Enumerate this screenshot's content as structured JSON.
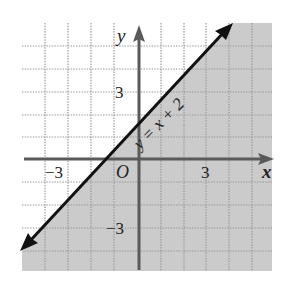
{
  "figure": {
    "type": "linear-inequality-graph",
    "equation_label": "y = x + 2",
    "boundary_line": {
      "slope": 1,
      "intercept": 2,
      "style": "solid",
      "arrows": "both"
    },
    "shaded_region": "below-right of line (y < x + 2)",
    "axes": {
      "x_label": "x",
      "y_label": "y",
      "origin_label": "O",
      "x_ticks": [
        {
          "value": -3,
          "label": "−3"
        },
        {
          "value": 3,
          "label": "3"
        }
      ],
      "y_ticks": [
        {
          "value": 3,
          "label": "3"
        },
        {
          "value": -3,
          "label": "−3"
        }
      ]
    },
    "grid": {
      "x_range": [
        -4,
        6
      ],
      "y_range": [
        -5,
        5
      ],
      "step": 1
    },
    "colors": {
      "shade": "#c9c9c9",
      "grid": "#9a9a9a",
      "axis": "#5a5a5a",
      "line": "#111111"
    }
  }
}
